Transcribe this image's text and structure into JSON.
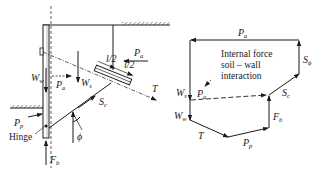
{
  "left_figure": {
    "labels": {
      "W_w": {
        "main": "W",
        "sub": "w"
      },
      "P_a_wall": {
        "main": "P",
        "sub": "a"
      },
      "W_s": {
        "main": "W",
        "sub": "s"
      },
      "P_a_top": {
        "main": "P",
        "sub": "a"
      },
      "half1": "l/2",
      "half2": "l/2",
      "T": {
        "main": "T",
        "sub": ""
      },
      "S_c": {
        "main": "S",
        "sub": "c"
      },
      "P_p": {
        "main": "P",
        "sub": "p"
      },
      "hinge": "Hinge",
      "phi": "ϕ",
      "F_b": {
        "main": "F",
        "sub": "b"
      }
    }
  },
  "right_figure": {
    "annotation_lines": [
      "Internal force",
      "soil – wall",
      "interaction"
    ],
    "labels": {
      "P_a_top": {
        "main": "P",
        "sub": "a"
      },
      "S_phi": {
        "main": "S",
        "sub": "ϕ"
      },
      "S_c": {
        "main": "S",
        "sub": "c"
      },
      "W_s": {
        "main": "W",
        "sub": "s"
      },
      "P_a_internal": {
        "main": "P",
        "sub": "a"
      },
      "W_w": {
        "main": "W",
        "sub": "w"
      },
      "T": {
        "main": "T",
        "sub": ""
      },
      "P_p": {
        "main": "P",
        "sub": "p"
      },
      "F_b": {
        "main": "F",
        "sub": "b"
      }
    }
  }
}
